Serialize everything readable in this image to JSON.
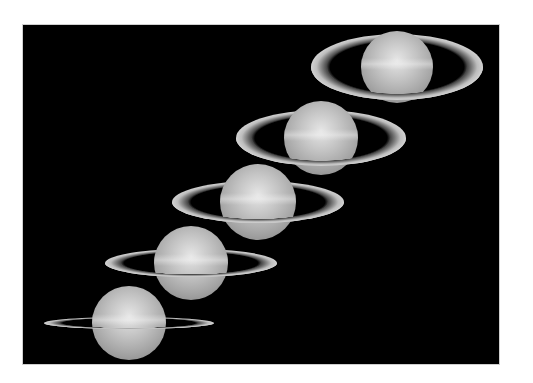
{
  "image": {
    "description": "Sequence of five Saturn images showing changing ring tilt",
    "background_color": "#000000",
    "page_color": "#ffffff"
  },
  "figures": [
    {
      "name": "saturn-1",
      "cx": 374,
      "cy": 42,
      "r": 36,
      "ring_w": 172,
      "ring_h": 66
    },
    {
      "name": "saturn-2",
      "cx": 298,
      "cy": 113,
      "r": 37,
      "ring_w": 170,
      "ring_h": 56
    },
    {
      "name": "saturn-3",
      "cx": 235,
      "cy": 177,
      "r": 38,
      "ring_w": 172,
      "ring_h": 42
    },
    {
      "name": "saturn-4",
      "cx": 168,
      "cy": 238,
      "r": 37,
      "ring_w": 172,
      "ring_h": 28
    },
    {
      "name": "saturn-5",
      "cx": 106,
      "cy": 298,
      "r": 37,
      "ring_w": 170,
      "ring_h": 12
    }
  ]
}
